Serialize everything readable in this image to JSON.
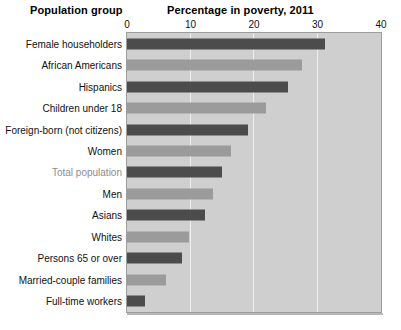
{
  "headings": {
    "group": "Population group",
    "value": "Percentage in poverty, 2011"
  },
  "axis": {
    "ticks": [
      "0",
      "10",
      "20",
      "30",
      "40"
    ],
    "min": 0,
    "max": 40,
    "gridlines": [
      10,
      20,
      30
    ]
  },
  "colors": {
    "bar_dark": "#4c4c4c",
    "bar_light": "#9b9b9b",
    "plot_background": "#cfcfcf",
    "page_background": "#ffffff",
    "muted_label": "#8d8d8d",
    "gridline": "#eeeeee"
  },
  "chart_data": {
    "type": "bar",
    "orientation": "horizontal",
    "title": "Percentage in poverty, 2011",
    "xlabel": "Percentage in poverty, 2011",
    "ylabel": "Population group",
    "xlim": [
      0,
      40
    ],
    "grid": true,
    "legend": "none",
    "categories": [
      "Female householders",
      "African Americans",
      "Hispanics",
      "Children under 18",
      "Foreign-born (not citizens)",
      "Women",
      "Total population",
      "Men",
      "Asians",
      "Whites",
      "Persons 65 or over",
      "Married-couple families",
      "Full-time workers"
    ],
    "values": [
      31.2,
      27.6,
      25.3,
      21.9,
      19.1,
      16.3,
      15.0,
      13.6,
      12.3,
      9.8,
      8.7,
      6.2,
      2.8
    ],
    "bar_styles": [
      "dark",
      "light",
      "dark",
      "light",
      "dark",
      "light",
      "dark",
      "light",
      "dark",
      "light",
      "dark",
      "light",
      "dark"
    ],
    "label_styles": [
      "normal",
      "normal",
      "normal",
      "normal",
      "normal",
      "normal",
      "muted",
      "normal",
      "normal",
      "normal",
      "normal",
      "normal",
      "normal"
    ]
  }
}
